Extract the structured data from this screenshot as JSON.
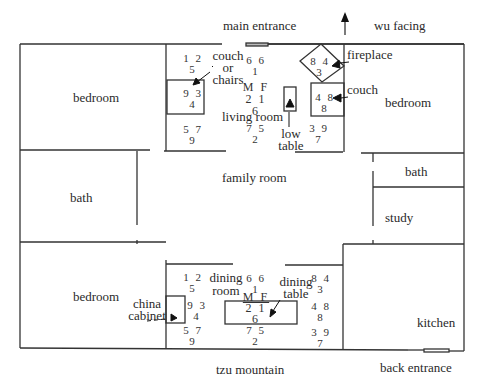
{
  "orientation": {
    "top_label": "main entrance",
    "facing_label": "wu facing",
    "bottom_label": "tzu mountain",
    "back_label": "back entrance"
  },
  "rooms": {
    "bedroom_nw": "bedroom",
    "bath_w": "bath",
    "bedroom_sw": "bedroom",
    "living_room": "living room",
    "family_room": "family room",
    "dining_room_line1": "dining",
    "dining_room_line2": "room",
    "bedroom_ne": "bedroom",
    "bath_e": "bath",
    "study": "study",
    "kitchen": "kitchen"
  },
  "furniture": {
    "couch_chairs_line1": "couch",
    "couch_chairs_line2": "or",
    "couch_chairs_line3": "chairs",
    "fireplace": "fireplace",
    "couch": "couch",
    "low_table_line1": "low",
    "low_table_line2": "table",
    "china_cabinet_line1": "china",
    "china_cabinet_line2": "cabinet",
    "dining_table_line1": "dining",
    "dining_table_line2": "table"
  },
  "living_numbers": {
    "nw_top": "1 2",
    "nw_bot": "5",
    "w_top": "9 3",
    "w_bot": "4",
    "sw_top": "5 7",
    "sw_bot": "9",
    "n_top": "6 6",
    "n_bot": "1",
    "center_mf": "M F",
    "center_mid": "2 1",
    "center_bot": "6",
    "s_top": "7 5",
    "s_bot": "2",
    "ne_top": "8 4",
    "ne_bot": "3",
    "e_top": "4 8",
    "e_bot": "8",
    "se_top": "3 9",
    "se_bot": "7"
  },
  "dining_numbers": {
    "nw_top": "1 2",
    "nw_bot": "5",
    "w_top": "9 3",
    "w_bot": "4",
    "sw_top": "5 7",
    "sw_bot": "9",
    "n_top": "6 6",
    "n_bot": "1",
    "center_mf": "M F",
    "center_mid": "2 1",
    "center_bot": "6",
    "s_top": "7 5",
    "s_bot": "2",
    "ne_top": "8 4",
    "ne_bot": "3",
    "e_top": "4 8",
    "e_bot": "8",
    "se_top": "3 9",
    "se_bot": "7"
  }
}
